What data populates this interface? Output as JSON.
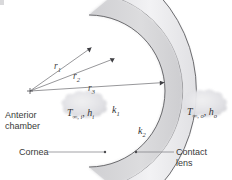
{
  "figure": {
    "background_color": "#ffffff",
    "line_color": "#3a3a3a",
    "text_color": "#3a3a3a"
  },
  "labels": {
    "anterior_chamber": "Anterior\nchamber",
    "cornea": "Cornea",
    "contact_lens": "Contact\nlens",
    "inner_fluid_T": "T",
    "inner_fluid_sub1": "∞, i",
    "inner_fluid_h": "h",
    "inner_fluid_sub2": "i",
    "outer_fluid_T": "T",
    "outer_fluid_sub1": "∞, o",
    "outer_fluid_h": "h",
    "outer_fluid_sub2": "o",
    "k_cornea": "k",
    "k_cornea_sub": "1",
    "k_lens": "k",
    "k_lens_sub": "2"
  },
  "radii": [
    {
      "name": "r1",
      "symbol": "r",
      "subscript": "1",
      "label_x": 55,
      "label_y": 62
    },
    {
      "name": "r2",
      "symbol": "r",
      "subscript": "2",
      "label_x": 74,
      "label_y": 72
    },
    {
      "name": "r3",
      "symbol": "r",
      "subscript": "3",
      "label_x": 89,
      "label_y": 84
    }
  ],
  "regions": {
    "cornea_fill": "#d5d5d7",
    "lens_fill": "#ececee",
    "cloud_fill": "#e3e3e6"
  },
  "geometry": {
    "origin_x": 30,
    "origin_y": 91,
    "arc1_radius": 76,
    "arc2_radius": 99,
    "arc3_radius": 142
  }
}
